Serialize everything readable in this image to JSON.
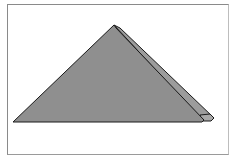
{
  "figure": {
    "colors": {
      "face": "#8f8f8f",
      "flap": "#9c9c9c",
      "outline": "#1a1a1a",
      "frame": "#8a8a8a",
      "background": "#ffffff"
    }
  }
}
